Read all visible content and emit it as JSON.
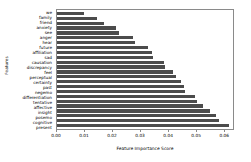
{
  "chart_data": {
    "type": "bar",
    "orientation": "horizontal",
    "title": "",
    "xlabel": "Feature Importance Score",
    "ylabel": "Features",
    "xlim": [
      0.0,
      0.0635
    ],
    "grid": false,
    "legend": null,
    "bar_color": "#4c4c4c",
    "xticks": [
      0.0,
      0.01,
      0.02,
      0.03,
      0.04,
      0.05,
      0.06
    ],
    "xtick_labels": [
      "0.00",
      "0.01",
      "0.02",
      "0.03",
      "0.04",
      "0.05",
      "0.06"
    ],
    "categories": [
      "we",
      "family",
      "friend",
      "anxiety",
      "see",
      "anger",
      "hear",
      "future",
      "affiliation",
      "sad",
      "causation",
      "discrepancy",
      "feel",
      "perceptual",
      "certainty",
      "past",
      "negemo",
      "differentiation",
      "tentative",
      "affective",
      "insight",
      "posemo",
      "cognitive",
      "present"
    ],
    "values": [
      0.0095,
      0.0142,
      0.0168,
      0.0212,
      0.0222,
      0.0272,
      0.0277,
      0.0325,
      0.0338,
      0.0344,
      0.0383,
      0.0387,
      0.0413,
      0.0425,
      0.0443,
      0.0452,
      0.0455,
      0.0492,
      0.0501,
      0.0521,
      0.0545,
      0.0568,
      0.0578,
      0.0612
    ]
  }
}
